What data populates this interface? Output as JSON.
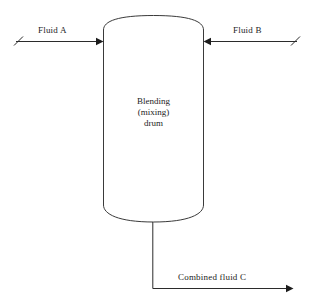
{
  "diagram": {
    "background_color": "#ffffff",
    "line_color": "#2b2b2b",
    "vessel_stroke_color": "#3a3a3a",
    "text_color": "#1c1c1c",
    "vessel": {
      "name": "blending-mixing-drum",
      "caption_line_1": "Blending",
      "caption_line_2": "(mixing)",
      "caption_line_3": "drum",
      "shape": "vertical-vessel-with-domed-heads",
      "left_wall_x": 103,
      "right_wall_x": 204,
      "top_tangent_y": 30,
      "bottom_tangent_y": 205,
      "top_dome_apex_y": 16,
      "bottom_dome_apex_y": 222
    },
    "streams": [
      {
        "id": "fluid-a",
        "label": "Fluid A",
        "direction": "inlet",
        "side": "left",
        "arrow_direction": "right",
        "line_y": 41,
        "tail_x": 16,
        "head_x": 103
      },
      {
        "id": "fluid-b",
        "label": "Fluid B",
        "direction": "inlet",
        "side": "right",
        "arrow_direction": "left",
        "line_y": 41,
        "tail_x": 297,
        "head_x": 204
      },
      {
        "id": "combined-fluid-c",
        "label": "Combined fluid C",
        "direction": "outlet",
        "side": "bottom",
        "arrow_direction": "right",
        "riser_x": 153,
        "riser_top_y": 222,
        "line_y": 288,
        "head_x": 293
      }
    ]
  }
}
